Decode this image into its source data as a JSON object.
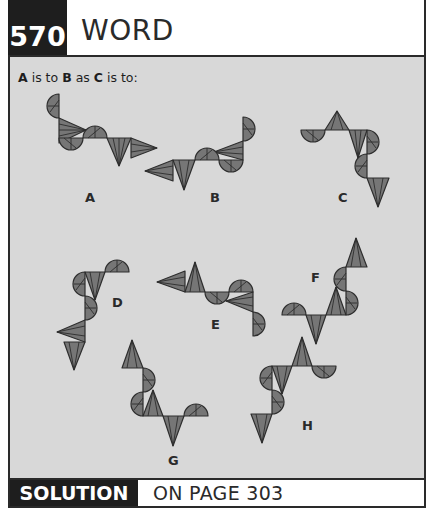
{
  "header": {
    "puzzle_number": "570",
    "title": "WORD"
  },
  "question": {
    "parts": [
      "A",
      " is to ",
      "B",
      " as ",
      "C",
      " is to:"
    ]
  },
  "figures": [
    {
      "label": "A"
    },
    {
      "label": "B"
    },
    {
      "label": "C"
    },
    {
      "label": "D"
    },
    {
      "label": "E"
    },
    {
      "label": "F"
    },
    {
      "label": "G"
    },
    {
      "label": "H"
    }
  ],
  "footer": {
    "solution_label": "SOLUTION",
    "page_reference": "ON PAGE 303"
  },
  "colors": {
    "dark": "#1e1e1e",
    "panel": "#d8d8d8",
    "shape_fill": "#767676"
  }
}
